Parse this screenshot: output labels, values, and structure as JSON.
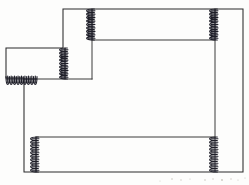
{
  "figure": {
    "kind": "line-drawing",
    "width": 249,
    "height": 185,
    "background_color": "#fdfdfc",
    "line_color": "#2b2b2b",
    "coil_color": "#1e1e28"
  },
  "chart_data": {
    "type": "diagram",
    "xlabel": "",
    "ylabel": "",
    "xlim": [
      0,
      249
    ],
    "ylim": [
      0,
      185
    ],
    "grid": false,
    "legend": "none",
    "annotations": [],
    "shapes": [
      {
        "name": "outer-stepped-outline",
        "kind": "polygon",
        "closed": true,
        "points": [
          [
            63,
            9
          ],
          [
            243,
            9
          ],
          [
            243,
            172
          ],
          [
            24,
            172
          ],
          [
            24,
            78
          ],
          [
            6,
            78
          ],
          [
            6,
            48
          ],
          [
            63,
            48
          ]
        ]
      },
      {
        "name": "upper-inner-horizontal",
        "kind": "polyline",
        "closed": false,
        "points": [
          [
            92,
            40
          ],
          [
            215,
            40
          ]
        ]
      },
      {
        "name": "upper-inner-vertical-left",
        "kind": "polyline",
        "closed": false,
        "points": [
          [
            92,
            9
          ],
          [
            92,
            79
          ]
        ]
      },
      {
        "name": "upper-inner-vertical-right",
        "kind": "polyline",
        "closed": false,
        "points": [
          [
            215,
            9
          ],
          [
            215,
            137
          ]
        ]
      },
      {
        "name": "step-inner-horizontal",
        "kind": "polyline",
        "closed": false,
        "points": [
          [
            24,
            79
          ],
          [
            92,
            79
          ]
        ]
      },
      {
        "name": "step-inner-vertical",
        "kind": "polyline",
        "closed": false,
        "points": [
          [
            65,
            48
          ],
          [
            65,
            79
          ]
        ]
      },
      {
        "name": "lower-inner-horizontal",
        "kind": "polyline",
        "closed": false,
        "points": [
          [
            36,
            137
          ],
          [
            215,
            137
          ]
        ]
      },
      {
        "name": "lower-inner-vertical-left",
        "kind": "polyline",
        "closed": false,
        "points": [
          [
            36,
            137
          ],
          [
            36,
            172
          ]
        ]
      }
    ],
    "springs": [
      {
        "name": "spring-top-left",
        "orientation": "vertical",
        "x": 92,
        "y_start": 9,
        "y_end": 40,
        "coils": 9,
        "amplitude": 4.2
      },
      {
        "name": "spring-top-right",
        "orientation": "vertical",
        "x": 215,
        "y_start": 9,
        "y_end": 40,
        "coils": 9,
        "amplitude": 4.2
      },
      {
        "name": "spring-step-vertical",
        "orientation": "vertical",
        "x": 65,
        "y_start": 48,
        "y_end": 79,
        "coils": 9,
        "amplitude": 4.2
      },
      {
        "name": "spring-left-horizontal",
        "orientation": "horizontal",
        "y": 79,
        "x_start": 6,
        "x_end": 37,
        "coils": 9,
        "amplitude": 4.2
      },
      {
        "name": "spring-bottom-left",
        "orientation": "vertical",
        "x": 36,
        "y_start": 137,
        "y_end": 172,
        "coils": 10,
        "amplitude": 4.2
      },
      {
        "name": "spring-bottom-right",
        "orientation": "vertical",
        "x": 215,
        "y_start": 137,
        "y_end": 172,
        "coils": 10,
        "amplitude": 4.2
      }
    ],
    "specks": [
      {
        "x": 172,
        "y": 179,
        "r": 0.8
      },
      {
        "x": 181,
        "y": 180,
        "r": 0.7
      },
      {
        "x": 190,
        "y": 179,
        "r": 0.6
      },
      {
        "x": 205,
        "y": 180,
        "r": 0.8
      },
      {
        "x": 213,
        "y": 179,
        "r": 0.7
      },
      {
        "x": 222,
        "y": 180,
        "r": 0.9
      },
      {
        "x": 231,
        "y": 179,
        "r": 0.7
      },
      {
        "x": 238,
        "y": 180,
        "r": 0.6
      },
      {
        "x": 160,
        "y": 181,
        "r": 0.5
      },
      {
        "x": 245,
        "y": 178,
        "r": 0.6
      }
    ]
  }
}
